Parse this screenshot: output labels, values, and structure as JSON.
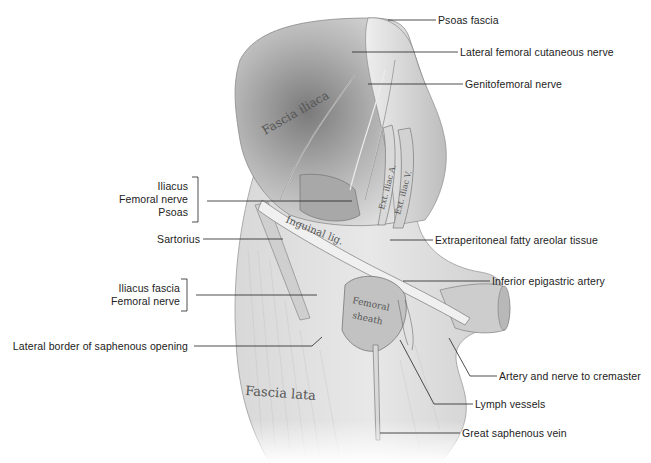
{
  "figure": {
    "type": "anatomical-illustration"
  },
  "embedded_labels": {
    "fascia_iliaca": "Fascia iliaca",
    "ext_iliac_a": "Ext. iliac A.",
    "ext_iliac_v": "Ext. iliac V.",
    "inguinal_lig": "Inguinal lig.",
    "femoral_sheath_1": "Femoral",
    "femoral_sheath_2": "sheath",
    "fascia_lata": "Fascia lata"
  },
  "labels_right": [
    {
      "text": "Psoas fascia"
    },
    {
      "text": "Lateral femoral cutaneous nerve"
    },
    {
      "text": "Genitofemoral nerve"
    },
    {
      "text": "Extraperitoneal fatty areolar tissue"
    },
    {
      "text": "Inferior epigastric artery"
    },
    {
      "text": "Artery and nerve to cremaster"
    },
    {
      "text": "Lymph vessels"
    },
    {
      "text": "Great saphenous vein"
    }
  ],
  "labels_left": {
    "group1": [
      "Iliacus",
      "Femoral nerve",
      "Psoas"
    ],
    "sartorius": "Sartorius",
    "group2": [
      "Iliacus fascia",
      "Femoral nerve"
    ],
    "lateral_border": "Lateral border of saphenous opening"
  },
  "colors": {
    "tissue_light": "#e6e6e6",
    "tissue_mid": "#c8c8c8",
    "tissue_dark": "#8a8a8a",
    "leader_line": "#222222"
  }
}
